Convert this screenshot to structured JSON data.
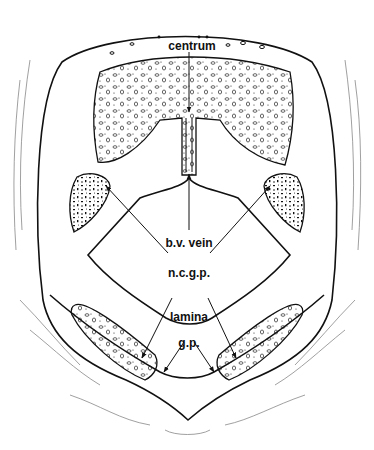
{
  "figure": {
    "labels": {
      "centrum": "centrum",
      "bv_vein": "b.v. vein",
      "ncgp": "n.c.g.p.",
      "lamina": "lamina",
      "gp": "g.p."
    },
    "colors": {
      "ink": "#111111",
      "background": "#ffffff"
    }
  }
}
